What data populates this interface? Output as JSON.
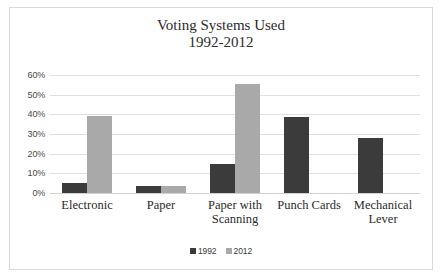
{
  "chart_data": {
    "type": "bar",
    "title": "Voting Systems Used\n1992-2012",
    "title_lines": [
      "Voting Systems Used",
      "1992-2012"
    ],
    "xlabel": "",
    "ylabel": "",
    "ylim": [
      0,
      60
    ],
    "ytick_labels": [
      "60%",
      "50%",
      "40%",
      "30%",
      "20%",
      "10%",
      "0%"
    ],
    "ytick_values": [
      60,
      50,
      40,
      30,
      20,
      10,
      0
    ],
    "grid": true,
    "legend_position": "bottom",
    "categories": [
      "Electronic",
      "Paper",
      "Paper with Scanning",
      "Punch Cards",
      "Mechanical Lever"
    ],
    "category_lines": [
      [
        "Electronic"
      ],
      [
        "Paper"
      ],
      [
        "Paper with",
        "Scanning"
      ],
      [
        "Punch Cards"
      ],
      [
        "Mechanical",
        "Lever"
      ]
    ],
    "series": [
      {
        "name": "1992",
        "color": "#3b3b3b",
        "values": [
          5,
          3.5,
          15,
          38.5,
          28
        ]
      },
      {
        "name": "2012",
        "color": "#a9a9a9",
        "values": [
          39,
          3.5,
          55.5,
          0,
          0
        ]
      }
    ]
  }
}
